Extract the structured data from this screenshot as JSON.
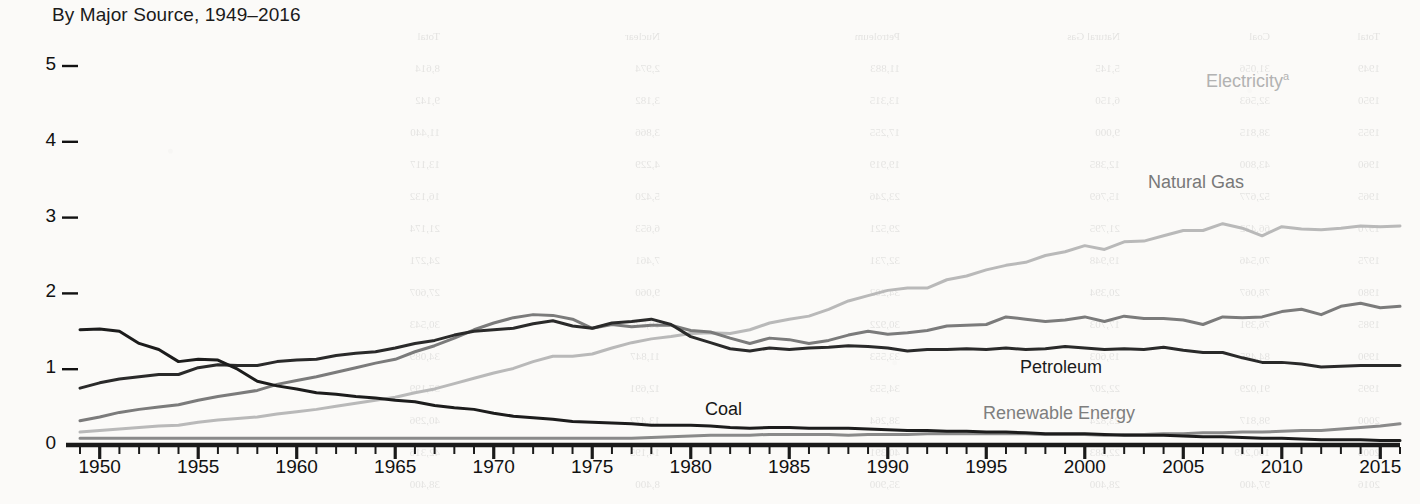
{
  "chart_data": {
    "type": "line",
    "title": "By Major Source, 1949–2016",
    "xlabel": "",
    "ylabel": "",
    "xlim": [
      1949,
      2016
    ],
    "ylim": [
      0,
      5.2
    ],
    "grid": false,
    "legend_position": "inline-right",
    "x_tick_labels": [
      "1950",
      "1955",
      "1960",
      "1965",
      "1970",
      "1975",
      "1980",
      "1985",
      "1990",
      "1995",
      "2000",
      "2005",
      "2010",
      "2015"
    ],
    "x_tick_values": [
      1950,
      1955,
      1960,
      1965,
      1970,
      1975,
      1980,
      1985,
      1990,
      1995,
      2000,
      2005,
      2010,
      2015
    ],
    "x_minor_tick_interval": 1,
    "y_tick_labels": [
      "0",
      "1",
      "2",
      "3",
      "4",
      "5"
    ],
    "y_tick_values": [
      0,
      1,
      2,
      3,
      4,
      5
    ],
    "x": [
      1949,
      1950,
      1951,
      1952,
      1953,
      1954,
      1955,
      1956,
      1957,
      1958,
      1959,
      1960,
      1961,
      1962,
      1963,
      1964,
      1965,
      1966,
      1967,
      1968,
      1969,
      1970,
      1971,
      1972,
      1973,
      1974,
      1975,
      1976,
      1977,
      1978,
      1979,
      1980,
      1981,
      1982,
      1983,
      1984,
      1985,
      1986,
      1987,
      1988,
      1989,
      1990,
      1991,
      1992,
      1993,
      1994,
      1995,
      1996,
      1997,
      1998,
      1999,
      2000,
      2001,
      2002,
      2003,
      2004,
      2005,
      2006,
      2007,
      2008,
      2009,
      2010,
      2011,
      2012,
      2013,
      2014,
      2015,
      2016
    ],
    "series": [
      {
        "name": "Electricity",
        "label": "Electricity",
        "footnote_marker": "a",
        "color": "#b9b9b9",
        "label_color": "#b2b2b2",
        "label_x": 1206,
        "label_y": 70,
        "values": [
          0.17,
          0.19,
          0.21,
          0.23,
          0.25,
          0.26,
          0.3,
          0.33,
          0.35,
          0.37,
          0.41,
          0.44,
          0.47,
          0.51,
          0.55,
          0.59,
          0.63,
          0.69,
          0.74,
          0.81,
          0.88,
          0.95,
          1.01,
          1.1,
          1.17,
          1.17,
          1.2,
          1.28,
          1.35,
          1.4,
          1.43,
          1.47,
          1.48,
          1.47,
          1.52,
          1.61,
          1.66,
          1.7,
          1.79,
          1.9,
          1.97,
          2.04,
          2.07,
          2.07,
          2.18,
          2.23,
          2.31,
          2.37,
          2.41,
          2.5,
          2.55,
          2.63,
          2.58,
          2.68,
          2.69,
          2.76,
          2.83,
          2.83,
          2.92,
          2.86,
          2.76,
          2.88,
          2.85,
          2.84,
          2.86,
          2.89,
          2.88,
          2.89
        ]
      },
      {
        "name": "Natural Gas",
        "label": "Natural Gas",
        "color": "#7b7b7b",
        "label_color": "#787878",
        "label_x": 1148,
        "label_y": 172,
        "values": [
          0.32,
          0.37,
          0.43,
          0.47,
          0.5,
          0.53,
          0.59,
          0.64,
          0.68,
          0.72,
          0.8,
          0.85,
          0.9,
          0.96,
          1.02,
          1.08,
          1.13,
          1.23,
          1.31,
          1.41,
          1.52,
          1.61,
          1.68,
          1.72,
          1.71,
          1.66,
          1.54,
          1.59,
          1.56,
          1.58,
          1.58,
          1.51,
          1.49,
          1.41,
          1.34,
          1.41,
          1.39,
          1.34,
          1.38,
          1.45,
          1.5,
          1.46,
          1.48,
          1.51,
          1.57,
          1.58,
          1.59,
          1.69,
          1.66,
          1.63,
          1.65,
          1.69,
          1.63,
          1.7,
          1.67,
          1.67,
          1.65,
          1.59,
          1.69,
          1.68,
          1.69,
          1.76,
          1.79,
          1.72,
          1.83,
          1.87,
          1.81,
          1.83
        ]
      },
      {
        "name": "Petroleum",
        "label": "Petroleum",
        "color": "#2a2a2a",
        "label_color": "#1c1c1c",
        "label_x": 1020,
        "label_y": 357,
        "values": [
          0.75,
          0.82,
          0.87,
          0.9,
          0.93,
          0.93,
          1.02,
          1.06,
          1.05,
          1.05,
          1.1,
          1.12,
          1.13,
          1.18,
          1.21,
          1.23,
          1.28,
          1.34,
          1.38,
          1.45,
          1.5,
          1.52,
          1.54,
          1.6,
          1.64,
          1.57,
          1.54,
          1.61,
          1.63,
          1.66,
          1.59,
          1.43,
          1.35,
          1.27,
          1.24,
          1.28,
          1.26,
          1.28,
          1.29,
          1.31,
          1.3,
          1.28,
          1.24,
          1.26,
          1.26,
          1.27,
          1.26,
          1.28,
          1.26,
          1.27,
          1.3,
          1.28,
          1.26,
          1.27,
          1.26,
          1.29,
          1.25,
          1.22,
          1.22,
          1.15,
          1.09,
          1.09,
          1.07,
          1.03,
          1.04,
          1.05,
          1.05,
          1.05
        ]
      },
      {
        "name": "Coal",
        "label": "Coal",
        "color": "#1c1c1c",
        "label_color": "#161616",
        "label_x": 705,
        "label_y": 399,
        "values": [
          1.52,
          1.53,
          1.5,
          1.34,
          1.26,
          1.1,
          1.13,
          1.12,
          1.0,
          0.84,
          0.78,
          0.74,
          0.69,
          0.67,
          0.64,
          0.62,
          0.59,
          0.57,
          0.52,
          0.49,
          0.47,
          0.42,
          0.38,
          0.36,
          0.34,
          0.31,
          0.3,
          0.29,
          0.28,
          0.26,
          0.26,
          0.26,
          0.25,
          0.23,
          0.22,
          0.23,
          0.23,
          0.22,
          0.22,
          0.22,
          0.21,
          0.2,
          0.19,
          0.19,
          0.18,
          0.18,
          0.17,
          0.17,
          0.16,
          0.15,
          0.15,
          0.15,
          0.14,
          0.13,
          0.13,
          0.13,
          0.12,
          0.11,
          0.11,
          0.1,
          0.09,
          0.09,
          0.08,
          0.07,
          0.07,
          0.07,
          0.06,
          0.06
        ]
      },
      {
        "name": "Renewable Energy",
        "label": "Renewable Energy",
        "color": "#8a8a8a",
        "label_color": "#7e7e7e",
        "label_x": 983,
        "label_y": 403,
        "values": [
          0.09,
          0.09,
          0.09,
          0.09,
          0.09,
          0.09,
          0.09,
          0.09,
          0.09,
          0.09,
          0.09,
          0.09,
          0.09,
          0.09,
          0.09,
          0.09,
          0.09,
          0.09,
          0.09,
          0.09,
          0.09,
          0.09,
          0.09,
          0.09,
          0.09,
          0.09,
          0.09,
          0.09,
          0.09,
          0.1,
          0.11,
          0.12,
          0.13,
          0.13,
          0.13,
          0.14,
          0.14,
          0.14,
          0.14,
          0.13,
          0.14,
          0.14,
          0.14,
          0.15,
          0.15,
          0.15,
          0.15,
          0.15,
          0.15,
          0.14,
          0.14,
          0.14,
          0.13,
          0.14,
          0.14,
          0.15,
          0.15,
          0.16,
          0.16,
          0.17,
          0.17,
          0.18,
          0.19,
          0.19,
          0.21,
          0.23,
          0.25,
          0.28
        ]
      }
    ]
  },
  "bleed_text": {
    "note": "faint show-through of table text from reverse of printed page",
    "words": [
      "Total",
      "Coal",
      "Natural Gas",
      "Petroleum",
      "Nuclear",
      "Total",
      "Renewable",
      "Energy",
      "Electricity",
      "1949 Total",
      "1950 Total",
      "1955 Total",
      "1960 Total",
      "1965 Total",
      "1970 Total",
      "1975 Total",
      "1980 Total",
      "1985 Total",
      "1990 Total",
      "1995 Total",
      "2000 Total",
      "2005 Total",
      "2010 Total",
      "2015 Total",
      "2016 Total"
    ]
  }
}
